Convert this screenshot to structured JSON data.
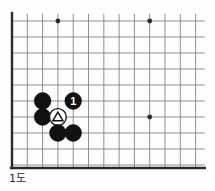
{
  "figure": {
    "caption": "1도",
    "kind": "go-board-diagram",
    "colors": {
      "background": "#fdfdfd",
      "grid_line": "#8f8f93",
      "board_edge": "#2b2b2b",
      "black_stone": "#111111",
      "white_stone": "#ffffff",
      "white_stone_outline": "#111111",
      "marker": "#111111",
      "label_text": "#ffffff",
      "caption_text": "#2a2a2a"
    }
  },
  "board": {
    "origin_x": 12,
    "origin_y": 21,
    "col_step": 15.3,
    "row_step": 16,
    "cols": 13,
    "rows": 10,
    "edge_left_x": 12,
    "edge_bottom_y": 168,
    "star_points": [
      {
        "col": 3,
        "row": 0
      },
      {
        "col": 9,
        "row": 0
      },
      {
        "col": 9,
        "row": 6
      }
    ]
  },
  "stones": [
    {
      "id": "black-a",
      "color": "black",
      "col": 2,
      "row": 5,
      "marker": "none",
      "label": ""
    },
    {
      "id": "black-move-1",
      "color": "black",
      "col": 4,
      "row": 5,
      "marker": "number",
      "label": "1"
    },
    {
      "id": "black-b",
      "color": "black",
      "col": 2,
      "row": 6,
      "marker": "none",
      "label": ""
    },
    {
      "id": "white-triangle",
      "color": "white",
      "col": 3,
      "row": 6,
      "marker": "triangle",
      "label": ""
    },
    {
      "id": "black-c",
      "color": "black",
      "col": 3,
      "row": 7,
      "marker": "none",
      "label": ""
    },
    {
      "id": "black-d",
      "color": "black",
      "col": 4,
      "row": 7,
      "marker": "none",
      "label": ""
    }
  ]
}
